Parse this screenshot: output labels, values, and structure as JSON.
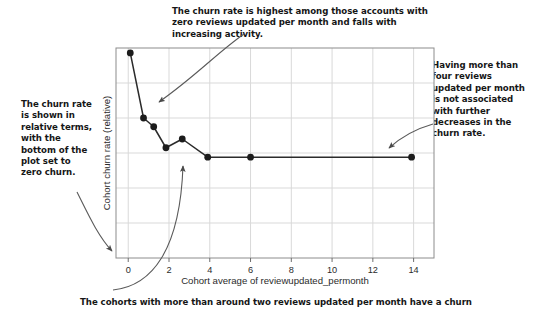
{
  "annotations": {
    "top": "The churn rate is highest among those accounts with zero reviews updated per month and falls with increasing activity.",
    "left": "The churn rate is shown in relative terms, with the bottom of the plot set to zero churn.",
    "right": "Having more than four reviews updated per month is not associated with further decreases in the churn rate.",
    "bottom": "The cohorts with more than around two reviews updated per month have a churn"
  },
  "colors": {
    "text": "#161616",
    "line": "#2b2b2b",
    "marker": "#1c1c1c",
    "grid": "#d9d9d9",
    "frame": "#8c8c8c",
    "arrow": "#4a4a4a"
  },
  "chart_data": {
    "type": "line",
    "title": "",
    "xlabel": "Cohort average of reviewupdated_permonth",
    "ylabel": "Cohort churn rate (relative)",
    "xlim": [
      -0.6,
      15.0
    ],
    "ylim": [
      0,
      6
    ],
    "xticks": [
      0,
      2,
      4,
      6,
      8,
      10,
      12,
      14
    ],
    "xtick_labels": [
      "0",
      "2",
      "4",
      "6",
      "8",
      "10",
      "12",
      "14"
    ],
    "yticks": [
      0,
      1,
      2,
      3,
      4,
      5,
      6
    ],
    "ytick_labels": [
      "",
      "",
      "",
      "",
      "",
      "",
      ""
    ],
    "grid": true,
    "legend": "none",
    "markers": "filled-circle",
    "series": [
      {
        "name": "Cohort churn rate (relative)",
        "x": [
          0.1,
          0.75,
          1.25,
          1.85,
          2.65,
          3.9,
          6.0,
          13.9
        ],
        "y": [
          5.86,
          4.0,
          3.75,
          3.15,
          3.4,
          2.88,
          2.88,
          2.88
        ]
      }
    ]
  }
}
